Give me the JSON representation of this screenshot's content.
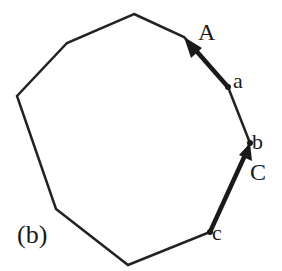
{
  "figure": {
    "panel_label": "(b)",
    "polygon": {
      "stroke": "#222222",
      "points": [
        [
          134,
          14
        ],
        [
          184,
          37
        ],
        [
          228,
          87
        ],
        [
          250,
          143
        ],
        [
          210,
          232
        ],
        [
          128,
          265
        ],
        [
          56,
          209
        ],
        [
          17,
          96
        ],
        [
          67,
          43
        ]
      ]
    },
    "arrows": [
      {
        "label": "A",
        "from_point": "a",
        "x1": 228,
        "y1": 87,
        "x2": 186,
        "y2": 40
      },
      {
        "label": "C",
        "from_point": "c",
        "x1": 210,
        "y1": 232,
        "x2": 250,
        "y2": 143
      }
    ],
    "points": [
      {
        "name": "a",
        "x": 228,
        "y": 87
      },
      {
        "name": "b",
        "x": 250,
        "y": 143
      },
      {
        "name": "c",
        "x": 210,
        "y": 232
      }
    ],
    "labels": {
      "A": "A",
      "a": "a",
      "b": "b",
      "C": "C",
      "c": "c"
    }
  }
}
